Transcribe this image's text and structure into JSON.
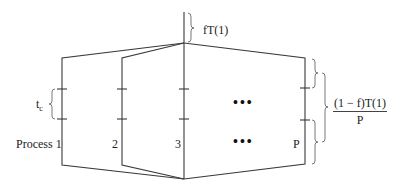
{
  "diagram": {
    "labels": {
      "serial_time": "fT(1)",
      "task_time": "t",
      "task_time_subscript": "c",
      "parallel_time_numerator": "(1 − f)T(1)",
      "parallel_time_denominator": "P",
      "process_1": "Process 1",
      "process_2": "2",
      "process_3": "3",
      "process_p": "P",
      "ellipsis_upper": "•••",
      "ellipsis_lower": "•••"
    },
    "colors": {
      "line": "#3a3a3a",
      "brace": "#6a6a6a",
      "text": "#222222",
      "background": "#ffffff"
    }
  }
}
